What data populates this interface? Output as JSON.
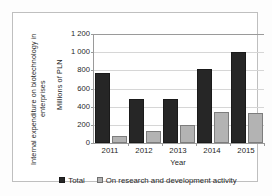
{
  "chart_data": {
    "type": "bar",
    "title": "",
    "subtitle": "",
    "xlabel": "Year",
    "ylabel": "Internal expenditure on biotechnology in enterprises",
    "ylabel_units": "Millions of PLN",
    "categories": [
      "2011",
      "2012",
      "2013",
      "2014",
      "2015"
    ],
    "series": [
      {
        "name": "Total",
        "color": "#262626",
        "values": [
          775,
          490,
          485,
          820,
          1000
        ]
      },
      {
        "name": "On research and development activity",
        "color": "#b3b3b3",
        "values": [
          75,
          130,
          195,
          345,
          335
        ]
      }
    ],
    "ylim": [
      0,
      1200
    ],
    "ytick_values": [
      0,
      200,
      400,
      600,
      800,
      1000,
      1200
    ],
    "ytick_labels": [
      "0",
      "200",
      "400",
      "600",
      "800",
      "1 000",
      "1 200"
    ],
    "grid": "horizontal",
    "legend_position": "bottom",
    "annotations": []
  },
  "legend": {
    "items": [
      {
        "label": "Total",
        "swatch": "legend-swatch-total"
      },
      {
        "label": "On research and development activity",
        "swatch": "legend-swatch-rnd"
      }
    ]
  }
}
